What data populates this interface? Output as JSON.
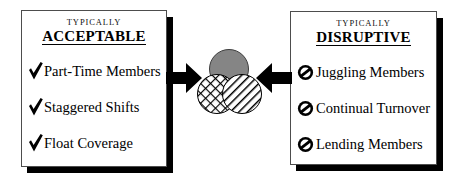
{
  "figure": {
    "title": "",
    "colors": {
      "ink": "#000000",
      "panel_border": "#4d4d4d",
      "panel_shadow": "#000000",
      "circle_gray": "#858585",
      "page_background": "#ffffff"
    }
  },
  "left_panel": {
    "kicker": "TYPICALLY",
    "headline": "ACCEPTABLE",
    "bullet_icon": "check-icon",
    "items": [
      {
        "label": "Part-Time Members"
      },
      {
        "label": "Staggered Shifts"
      },
      {
        "label": "Float Coverage"
      }
    ]
  },
  "right_panel": {
    "kicker": "TYPICALLY",
    "headline": "DISRUPTIVE",
    "bullet_icon": "prohibition-icon",
    "items": [
      {
        "label": "Juggling Members"
      },
      {
        "label": "Continual Turnover"
      },
      {
        "label": "Lending Members"
      }
    ]
  },
  "center_graphic": {
    "description": "three overlapping circles",
    "circles": [
      {
        "name": "top-circle",
        "fill": "solid-gray",
        "color": "#858585"
      },
      {
        "name": "bottom-left-circle",
        "fill": "crosshatch",
        "color": "#000000"
      },
      {
        "name": "bottom-right-circle",
        "fill": "diagonal-stripes",
        "color": "#000000"
      }
    ],
    "arrows": [
      {
        "name": "left-arrow",
        "direction": "right"
      },
      {
        "name": "right-arrow",
        "direction": "left"
      }
    ]
  }
}
